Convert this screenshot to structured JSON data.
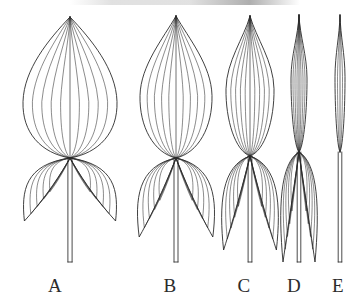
{
  "figure": {
    "kind": "botanical-line-illustration",
    "background_color": "#ffffff",
    "ink_color": "#2b2b2b",
    "width": 361,
    "height": 306
  },
  "labels": [
    {
      "text": "A",
      "x": 55,
      "y": 275
    },
    {
      "text": "B",
      "x": 170,
      "y": 275
    },
    {
      "text": "C",
      "x": 244,
      "y": 275
    },
    {
      "text": "D",
      "x": 294,
      "y": 275
    },
    {
      "text": "E",
      "x": 338,
      "y": 275
    }
  ],
  "specimens": [
    {
      "id": "A",
      "name": "broad-ovate-sagittate-leaf",
      "blade_half_width": 47,
      "blade_top_y": 17,
      "node_y": 158,
      "lobe_half_width": 47,
      "lobe_tip_y": 221,
      "lobe_spread": 0.97,
      "apex_sharpness": 0.46,
      "shoulder": 0.6,
      "vein_pairs": 4,
      "lobe_vein_pairs": 4,
      "petiole_x": 70,
      "petiole_bottom_y": 262,
      "petiole_half_width": 2.1
    },
    {
      "id": "B",
      "name": "narrow-ovate-sagittate-leaf",
      "blade_half_width": 36,
      "blade_top_y": 16,
      "node_y": 158,
      "lobe_half_width": 40,
      "lobe_tip_y": 237,
      "lobe_spread": 0.92,
      "apex_sharpness": 0.36,
      "shoulder": 0.56,
      "vein_pairs": 4,
      "lobe_vein_pairs": 4,
      "petiole_x": 176,
      "petiole_bottom_y": 262,
      "petiole_half_width": 2.0
    },
    {
      "id": "C",
      "name": "lanceolate-sagittate-leaf",
      "blade_half_width": 24,
      "blade_top_y": 16,
      "node_y": 156,
      "lobe_half_width": 30,
      "lobe_tip_y": 250,
      "lobe_spread": 0.88,
      "apex_sharpness": 0.26,
      "shoulder": 0.52,
      "vein_pairs": 4,
      "lobe_vein_pairs": 4,
      "petiole_x": 250,
      "petiole_bottom_y": 262,
      "petiole_half_width": 1.9
    },
    {
      "id": "D",
      "name": "linear-sagittate-leaf",
      "blade_half_width": 8,
      "blade_top_y": 15,
      "node_y": 152,
      "lobe_half_width": 20,
      "lobe_tip_y": 262,
      "lobe_spread": 0.8,
      "apex_sharpness": 0.12,
      "shoulder": 0.46,
      "vein_pairs": 3,
      "lobe_vein_pairs": 4,
      "petiole_x": 299,
      "petiole_bottom_y": 262,
      "petiole_half_width": 1.8
    },
    {
      "id": "E",
      "name": "linear-entire-leaf",
      "blade_half_width": 5,
      "blade_top_y": 15,
      "node_y": 152,
      "lobe_half_width": 0,
      "lobe_tip_y": 152,
      "lobe_spread": 0,
      "apex_sharpness": 0.1,
      "shoulder": 0.45,
      "vein_pairs": 1,
      "lobe_vein_pairs": 0,
      "petiole_x": 340,
      "petiole_bottom_y": 262,
      "petiole_half_width": 1.8
    }
  ]
}
